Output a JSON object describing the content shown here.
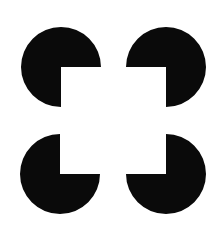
{
  "figure": {
    "width": 220,
    "height": 231,
    "background": "#ffffff",
    "fill": "#0a0a0a",
    "radius": 40,
    "inducers": [
      {
        "id": "top-left",
        "cx": 61,
        "cy": 67,
        "notch": "bottom-right"
      },
      {
        "id": "top-right",
        "cx": 166,
        "cy": 67,
        "notch": "bottom-left"
      },
      {
        "id": "bottom-left",
        "cx": 60,
        "cy": 174,
        "notch": "top-right"
      },
      {
        "id": "bottom-right",
        "cx": 166,
        "cy": 174,
        "notch": "top-left"
      }
    ]
  }
}
